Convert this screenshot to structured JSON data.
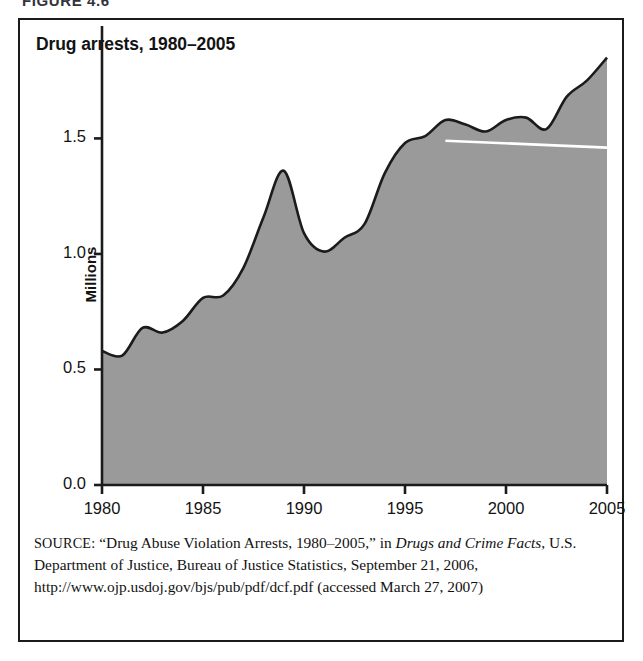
{
  "figure": {
    "caption": "FIGURE 4.6",
    "title": "Drug arrests, 1980–2005"
  },
  "source": {
    "keyword": "SOURCE:",
    "line_1": "“Drug Abuse Violation Arrests, 1980–2005,” in ",
    "italic_1": "Drugs and",
    "italic_2": "Crime Facts",
    "line_2": ", U.S. Department of Justice, Bureau of Justice Statistics,",
    "line_3": "September 21, 2006, http://www.ojp.usdoj.gov/bjs/pub/pdf/dcf.pdf",
    "line_4": "(accessed March 27, 2007)"
  },
  "colors": {
    "area_fill": "#9a9a9a",
    "area_stroke": "#1b1b1b",
    "axis": "#1b1b1b",
    "highlight_line": "#ffffff",
    "frame": "#1b1b1b",
    "text": "#131313"
  },
  "chart_data": {
    "type": "area",
    "title": "Drug arrests, 1980–2005",
    "xlabel": "",
    "ylabel": "Millions",
    "xlim": [
      1980,
      2005
    ],
    "ylim": [
      0.0,
      1.9
    ],
    "grid": false,
    "legend": null,
    "x_ticks": [
      "1980",
      "1985",
      "1990",
      "1995",
      "2000",
      "2005"
    ],
    "x_tick_values": [
      1980,
      1985,
      1990,
      1995,
      2000,
      2005
    ],
    "y_ticks": [
      "0.0",
      "0.5",
      "1.0",
      "1.5"
    ],
    "y_tick_values": [
      0.0,
      0.5,
      1.0,
      1.5
    ],
    "x": [
      1980,
      1981,
      1982,
      1983,
      1984,
      1985,
      1986,
      1987,
      1988,
      1989,
      1990,
      1991,
      1992,
      1993,
      1994,
      1995,
      1996,
      1997,
      1998,
      1999,
      2000,
      2001,
      2002,
      2003,
      2004,
      2005
    ],
    "values": [
      0.58,
      0.56,
      0.68,
      0.66,
      0.71,
      0.81,
      0.82,
      0.94,
      1.16,
      1.36,
      1.09,
      1.01,
      1.07,
      1.13,
      1.35,
      1.48,
      1.51,
      1.58,
      1.56,
      1.53,
      1.58,
      1.59,
      1.54,
      1.68,
      1.75,
      1.85
    ],
    "series": [
      {
        "name": "Drug abuse violation arrests",
        "values": [
          0.58,
          0.56,
          0.68,
          0.66,
          0.71,
          0.81,
          0.82,
          0.94,
          1.16,
          1.36,
          1.09,
          1.01,
          1.07,
          1.13,
          1.35,
          1.48,
          1.51,
          1.58,
          1.56,
          1.53,
          1.58,
          1.59,
          1.54,
          1.68,
          1.75,
          1.85
        ]
      }
    ],
    "annotations": [
      {
        "type": "line",
        "name": "white-highlight-line",
        "color": "#ffffff",
        "x_start": 1997,
        "y_start": 1.49,
        "x_end": 2005,
        "y_end": 1.46
      }
    ]
  }
}
